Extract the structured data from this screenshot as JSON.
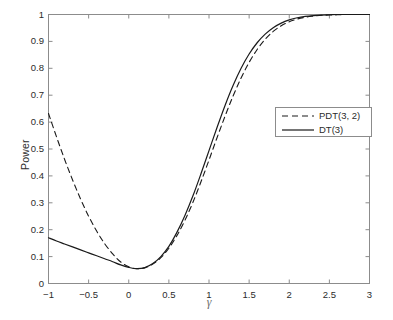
{
  "chart_data": {
    "type": "line",
    "title": "",
    "xlabel": "γ",
    "ylabel": "Power",
    "xlim": [
      -1,
      3
    ],
    "ylim": [
      0,
      1
    ],
    "grid": false,
    "legend_position": "upper-right-inside",
    "xticks": [
      -1,
      -0.5,
      0,
      0.5,
      1,
      1.5,
      2,
      2.5,
      3
    ],
    "xticklabels": [
      "−1",
      "−0.5",
      "0",
      "0.5",
      "1",
      "1.5",
      "2",
      "2.5",
      "3"
    ],
    "yticks": [
      0,
      0.1,
      0.2,
      0.3,
      0.4,
      0.5,
      0.6,
      0.7,
      0.8,
      0.9,
      1
    ],
    "yticklabels": [
      "0",
      "0.1",
      "0.2",
      "0.3",
      "0.4",
      "0.5",
      "0.6",
      "0.7",
      "0.8",
      "0.9",
      "1"
    ],
    "x": [
      -1,
      -0.9,
      -0.8,
      -0.7,
      -0.6,
      -0.5,
      -0.4,
      -0.3,
      -0.2,
      -0.1,
      0,
      0.1,
      0.2,
      0.3,
      0.4,
      0.5,
      0.6,
      0.7,
      0.8,
      0.9,
      1,
      1.1,
      1.2,
      1.3,
      1.4,
      1.5,
      1.6,
      1.7,
      1.8,
      1.9,
      2,
      2.1,
      2.2,
      2.3,
      2.4,
      2.5,
      2.6,
      2.7,
      2.8,
      2.9,
      3
    ],
    "series": [
      {
        "name": "PDT(3, 2)",
        "style": "dashed",
        "color": "#1a1a1a",
        "values": [
          0.632,
          0.545,
          0.462,
          0.385,
          0.314,
          0.25,
          0.195,
          0.148,
          0.11,
          0.08,
          0.062,
          0.055,
          0.058,
          0.072,
          0.096,
          0.131,
          0.178,
          0.235,
          0.302,
          0.378,
          0.459,
          0.542,
          0.622,
          0.697,
          0.764,
          0.822,
          0.87,
          0.908,
          0.937,
          0.958,
          0.973,
          0.983,
          0.99,
          0.994,
          0.997,
          0.998,
          0.999,
          1.0,
          1.0,
          1.0,
          1.0
        ]
      },
      {
        "name": "DT(3)",
        "style": "solid",
        "color": "#1a1a1a",
        "values": [
          0.17,
          0.158,
          0.147,
          0.136,
          0.125,
          0.114,
          0.103,
          0.092,
          0.081,
          0.069,
          0.06,
          0.055,
          0.059,
          0.074,
          0.1,
          0.138,
          0.19,
          0.253,
          0.326,
          0.408,
          0.494,
          0.58,
          0.662,
          0.736,
          0.8,
          0.853,
          0.895,
          0.927,
          0.951,
          0.968,
          0.98,
          0.988,
          0.993,
          0.996,
          0.998,
          0.999,
          1.0,
          1.0,
          1.0,
          1.0,
          1.0
        ]
      }
    ]
  },
  "legend": {
    "entries": [
      {
        "label": "PDT(3, 2)",
        "style": "dashed"
      },
      {
        "label": "DT(3)",
        "style": "solid"
      }
    ]
  },
  "axes": {
    "ylabel": "Power",
    "xlabel": "γ"
  },
  "colors": {
    "axis": "#8c8c8c",
    "line": "#1a1a1a",
    "text": "#2b2b2b",
    "background": "#ffffff"
  }
}
